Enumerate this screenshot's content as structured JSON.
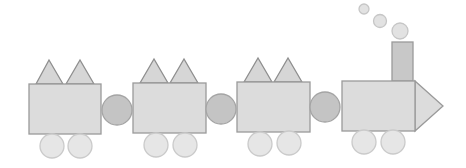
{
  "colors": {
    "background": "#ffffff",
    "body_fill": "#dcdcdc",
    "body_stroke": "#9a9a9a",
    "roof_fill": "#d6d6d6",
    "roof_stroke": "#8e8e8e",
    "coupler_fill": "#c4c4c4",
    "coupler_stroke": "#a4a4a4",
    "wheel_fill": "#e6e6e6",
    "wheel_stroke": "#cacaca",
    "chimney_fill": "#c8c8c8",
    "chimney_stroke": "#9a9a9a",
    "smoke_fill": "#e2e2e2",
    "smoke_stroke": "#c6c6c6"
  },
  "cars": [
    {
      "name": "car-1",
      "rect": {
        "x": 29,
        "y": 84,
        "w": 72,
        "h": 50
      },
      "roof_triangles": [
        {
          "apex": [
            49,
            60
          ],
          "base": [
            36,
            63
          ]
        },
        {
          "apex": [
            80,
            60
          ],
          "base": [
            66,
            94
          ]
        }
      ],
      "wheels": [
        {
          "cx": 52,
          "cy": 146,
          "r": 12
        },
        {
          "cx": 80,
          "cy": 146,
          "r": 12
        }
      ]
    },
    {
      "name": "car-2",
      "rect": {
        "x": 133,
        "y": 83,
        "w": 73,
        "h": 50
      },
      "roof_triangles": [
        {
          "apex": [
            154,
            59
          ],
          "base": [
            140,
            168
          ]
        },
        {
          "apex": [
            184,
            59
          ],
          "base": [
            170,
            198
          ]
        }
      ],
      "wheels": [
        {
          "cx": 156,
          "cy": 145,
          "r": 12
        },
        {
          "cx": 185,
          "cy": 145,
          "r": 12
        }
      ]
    },
    {
      "name": "car-3",
      "rect": {
        "x": 237,
        "y": 82,
        "w": 73,
        "h": 50
      },
      "roof_triangles": [
        {
          "apex": [
            258,
            58
          ],
          "base": [
            244,
            272
          ]
        },
        {
          "apex": [
            288,
            58
          ],
          "base": [
            274,
            302
          ]
        }
      ],
      "wheels": [
        {
          "cx": 260,
          "cy": 144,
          "r": 12
        },
        {
          "cx": 289,
          "cy": 143,
          "r": 12
        }
      ]
    }
  ],
  "couplers": [
    {
      "cx": 117,
      "cy": 110,
      "r": 15
    },
    {
      "cx": 221,
      "cy": 109,
      "r": 15
    },
    {
      "cx": 325,
      "cy": 107,
      "r": 15
    }
  ],
  "engine": {
    "rect": {
      "x": 342,
      "y": 81,
      "w": 73,
      "h": 50
    },
    "chimney": {
      "x": 392,
      "y": 42,
      "w": 21,
      "h": 39
    },
    "nose": {
      "points": "415,81 443,106 415,131"
    },
    "wheels": [
      {
        "cx": 364,
        "cy": 142,
        "r": 12
      },
      {
        "cx": 393,
        "cy": 142,
        "r": 12
      }
    ],
    "smoke": [
      {
        "cx": 364,
        "cy": 9,
        "r": 5
      },
      {
        "cx": 380,
        "cy": 21,
        "r": 6.5
      },
      {
        "cx": 400,
        "cy": 31,
        "r": 8
      }
    ]
  }
}
